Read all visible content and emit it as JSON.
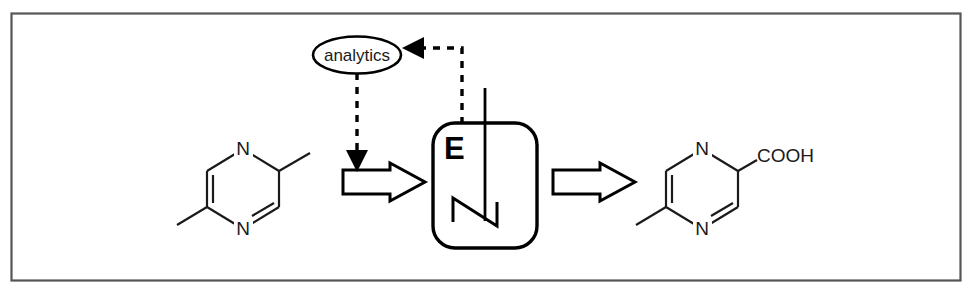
{
  "figure": {
    "type": "process-flow-diagram",
    "frame": {
      "stroke_color": "#555555",
      "fill_color": "#ffffff"
    },
    "line_color": "#1a1a1a"
  },
  "substrate": {
    "name": "substrate-molecule",
    "compound": "2,5-dimethylpyrazine",
    "atom_labels": [
      {
        "text": "N",
        "position": "ring-top"
      },
      {
        "text": "N",
        "position": "ring-bottom"
      }
    ]
  },
  "product": {
    "name": "product-molecule",
    "compound": "5-methylpyrazine-2-carboxylic acid",
    "atom_labels": [
      {
        "text": "N",
        "position": "ring-top"
      },
      {
        "text": "N",
        "position": "ring-bottom"
      }
    ],
    "substituent_label": "COOH"
  },
  "reactor": {
    "name": "stirred-tank-reactor",
    "label": "E",
    "has_stirrer": true,
    "impeller": "z-blade"
  },
  "analytics": {
    "label": "analytics",
    "shape": "ellipse"
  },
  "arrows": {
    "inlet": {
      "name": "inlet-block-arrow",
      "direction": "right"
    },
    "outlet": {
      "name": "outlet-block-arrow",
      "direction": "right"
    },
    "feedback_to_analytics": {
      "name": "sampling-dashed-arrow",
      "style": "dashed",
      "direction": "left"
    },
    "control_to_inlet": {
      "name": "control-dashed-arrow",
      "style": "dashed",
      "direction": "down"
    }
  }
}
